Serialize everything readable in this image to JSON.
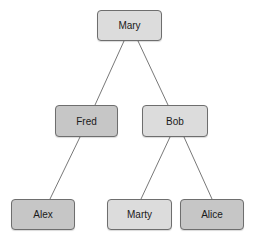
{
  "diagram": {
    "type": "tree",
    "nodes": [
      {
        "id": "mary",
        "label": "Mary",
        "shade": "light"
      },
      {
        "id": "fred",
        "label": "Fred",
        "shade": "dark"
      },
      {
        "id": "bob",
        "label": "Bob",
        "shade": "light"
      },
      {
        "id": "alex",
        "label": "Alex",
        "shade": "dark"
      },
      {
        "id": "marty",
        "label": "Marty",
        "shade": "light"
      },
      {
        "id": "alice",
        "label": "Alice",
        "shade": "dark"
      }
    ],
    "edges": [
      {
        "from": "mary",
        "to": "fred"
      },
      {
        "from": "mary",
        "to": "bob"
      },
      {
        "from": "fred",
        "to": "alex"
      },
      {
        "from": "bob",
        "to": "marty"
      },
      {
        "from": "bob",
        "to": "alice"
      }
    ],
    "colors": {
      "light": "#dcdcdc",
      "dark": "#c6c6c6",
      "border": "#6e6e6e",
      "edge": "#555555"
    }
  }
}
